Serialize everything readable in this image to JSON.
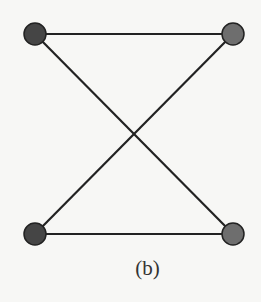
{
  "diagram": {
    "caption": "(b)",
    "nodes": [
      {
        "id": "top-left",
        "x": 35,
        "y": 34,
        "r": 11,
        "fill": "#454545"
      },
      {
        "id": "top-right",
        "x": 233,
        "y": 34,
        "r": 11,
        "fill": "#6e6e6e"
      },
      {
        "id": "bottom-left",
        "x": 35,
        "y": 234,
        "r": 11,
        "fill": "#454545"
      },
      {
        "id": "bottom-right",
        "x": 233,
        "y": 234,
        "r": 11,
        "fill": "#6e6e6e"
      }
    ],
    "edges": [
      {
        "from": "top-left",
        "to": "top-right"
      },
      {
        "from": "bottom-left",
        "to": "bottom-right"
      },
      {
        "from": "top-left",
        "to": "bottom-right"
      },
      {
        "from": "bottom-left",
        "to": "top-right"
      }
    ],
    "colors": {
      "edge": "#222222",
      "node_stroke": "#222222",
      "background": "#f7f7f5"
    }
  }
}
